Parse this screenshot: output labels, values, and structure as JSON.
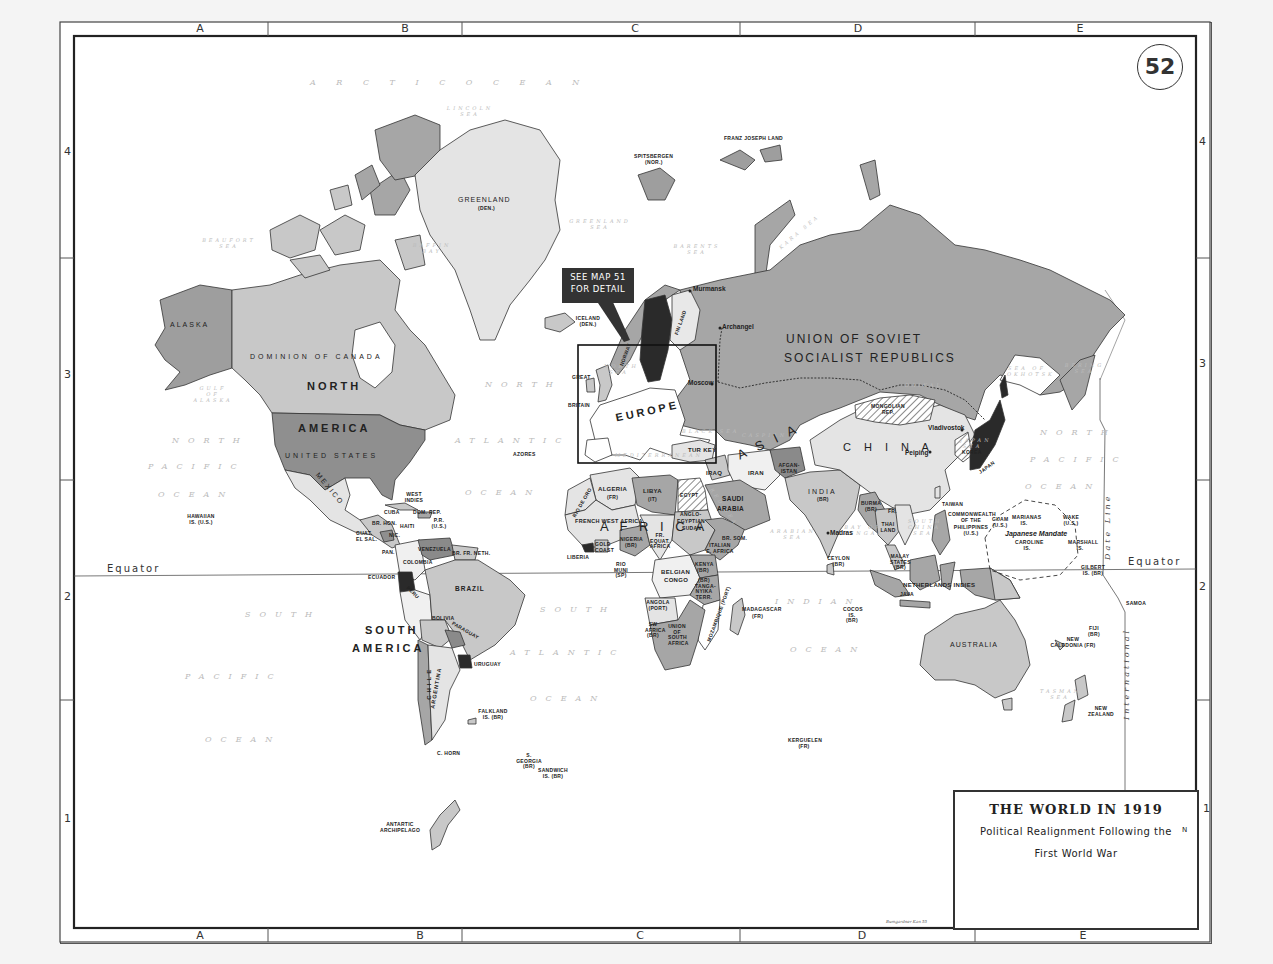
{
  "map": {
    "number": "52",
    "title": "THE WORLD IN 1919",
    "subtitle_line1": "Political Realignment Following the",
    "subtitle_line2": "First World War",
    "callout": {
      "line1": "SEE MAP 51",
      "line2": "FOR DETAIL"
    },
    "north_arrow": "N",
    "signature": "Bumgardner Kan 55"
  },
  "grid": {
    "columns_top": [
      "A",
      "B",
      "C",
      "D",
      "E"
    ],
    "columns_bottom": [
      "A",
      "B",
      "C",
      "D",
      "E"
    ],
    "rows_left": [
      "4",
      "3",
      "2",
      "1"
    ],
    "rows_right": [
      "4",
      "3",
      "2",
      "1"
    ]
  },
  "lines": {
    "equator_left": "Equator",
    "equator_right": "Equator",
    "date_line_top": "Date Line",
    "date_line_bottom": "International"
  },
  "continents": {
    "north_america_1": "NORTH",
    "north_america_2": "AMERICA",
    "south_america_1": "SOUTH",
    "south_america_2": "AMERICA",
    "europe": "EUROPE",
    "africa": "A F R I C A",
    "asia": "A S I A"
  },
  "oceans": {
    "arctic": "A R C T I C   O C E A N",
    "north_atlantic_1": "NORTH",
    "north_atlantic_2": "ATLANTIC",
    "north_atlantic_3": "OCEAN",
    "south_atlantic_1": "SOUTH",
    "south_atlantic_2": "ATLANTIC",
    "south_atlantic_3": "OCEAN",
    "north_pacific_w1": "NORTH",
    "north_pacific_w2": "PACIFIC",
    "north_pacific_w3": "OCEAN",
    "south_pacific_w1": "SOUTH",
    "south_pacific_w2": "PACIFIC",
    "south_pacific_w3": "OCEAN",
    "north_pacific_e1": "NORTH",
    "north_pacific_e2": "PACIFIC",
    "north_pacific_e3": "OCEAN",
    "indian_1": "INDIAN",
    "indian_2": "OCEAN"
  },
  "seas": {
    "lincoln": "LINCOLN SEA",
    "beaufort": "BEAUFORT SEA",
    "baffin": "BAFFIN BAY",
    "greenland": "GREENLAND SEA",
    "barents": "BARENTS SEA",
    "kara": "KARA SEA",
    "north_sea": "NORTH SEA",
    "gulf_alaska": "GULF OF ALASKA",
    "mediterranean": "MEDITERRANEAN",
    "black": "BLACK SEA",
    "caspian": "CASPIAN",
    "red": "RED SEA",
    "arabian": "ARABIAN SEA",
    "bay_bengal": "BAY OF BENGAL",
    "south_china": "SOUTH CHINA SEA",
    "japan": "JAPAN SEA",
    "okhotsk": "SEA OF OKHOTSK",
    "bering": "BERING SEA",
    "tasman": "TASMAN SEA",
    "baikal": "BAIKAL"
  },
  "countries": {
    "alaska": "ALASKA",
    "canada": "DOMINION OF CANADA",
    "usa": "UNITED STATES",
    "mexico": "MEXICO",
    "greenland": "GREENLAND",
    "greenland_owner": "(DEN.)",
    "iceland": "ICELAND (DEN.)",
    "spitsbergen": "SPITSBERGEN",
    "spitsbergen_owner": "(NOR.)",
    "franz_josef": "FRANZ JOSEPH LAND",
    "ussr_1": "UNION OF SOVIET",
    "ussr_2": "SOCIALIST REPUBLICS",
    "finland": "FIN LAND",
    "great_britain_1": "GREAT",
    "great_britain_2": "BRITAIN",
    "norway": "NORWAY",
    "turkey": "TUR KEY",
    "mongolia": "MONGOLIAN REP.",
    "china": "C H I N A",
    "korea": "KOREA",
    "japan": "JAPAN",
    "india": "INDIA",
    "india_owner": "(BR)",
    "iran": "IRAN",
    "iraq": "IRAQ",
    "afghanistan": "AFGAN- ISTAN",
    "saudi_1": "SAUDI",
    "saudi_2": "ARABIA",
    "burma": "BURMA (BR)",
    "thailand": "THAI LAND",
    "fr_indochina": "FR.",
    "malay": "MALAY STATES (BR)",
    "ceylon": "CEYLON (BR)",
    "taiwan": "TAIWAN",
    "philippines_1": "COMMONWEALTH OF THE",
    "philippines_2": "PHILIPPINES (U.S.)",
    "netherlands_indies": "NETHERLANDS INDIES",
    "java": "JAVA",
    "australia": "AUSTRALIA",
    "new_zealand": "NEW ZEALAND",
    "new_caledonia": "NEW CALEDONIA (FR)",
    "fiji": "FIJI (BR)",
    "samoa": "SAMOA",
    "japanese_mandate": "Japanese Mandate",
    "marianas": "MARIANAS IS.",
    "caroline": "CAROLINE IS.",
    "marshall": "MARSHALL IS.",
    "gilbert": "GILBERT IS. (BR)",
    "wake": "WAKE (U.S.)",
    "guam": "GUAM (U.S.)",
    "hawaiian": "HAWAIIAN IS. (U.S.)",
    "algeria": "ALGERIA",
    "algeria_owner": "(FR)",
    "libya": "LIBYA",
    "libya_owner": "(IT)",
    "egypt": "EGYPT",
    "rio_de_oro": "RIO DE ORO",
    "french_west_africa": "FRENCH WEST AFRICA",
    "nigeria": "NIGERIA (BR)",
    "gold_coast": "GOLD COAST",
    "liberia": "LIBERIA",
    "rio_muni": "RIO MUNI (SP)",
    "fr_equat": "FR. EQUAT. AFRICA",
    "anglo_egyptian_1": "ANGLO-",
    "anglo_egyptian_2": "EGYPTIAN",
    "anglo_egyptian_3": "SUDAN",
    "br_som": "BR. SOM.",
    "italian_e_africa": "ITALIAN E. AFRICA",
    "kenya": "KENYA (BR)",
    "tanganyika": "(BR) TANGA- NYIKA TERR.",
    "belgian_congo_1": "BELGIAN",
    "belgian_congo_2": "CONGO",
    "angola": "ANGOLA (PORT)",
    "sw_africa": "SW AFRICA (BR)",
    "union_south_africa": "UNION OF SOUTH AFRICA",
    "mozambique": "MOZAMBIQUE (PORT)",
    "madagascar": "MADAGASCAR",
    "madagascar_owner": "(FR)",
    "kerguelen": "KERGUELEN (FR)",
    "cocos": "COCOS IS. (BR)",
    "azores": "AZORES",
    "west_indies": "WEST INDIES",
    "cuba": "CUBA",
    "dom_rep": "DOM. REP.",
    "haiti": "HAITI",
    "pr": "P.R. (U.S.)",
    "br_hon": "BR. HON.",
    "guat": "GUAT.",
    "el_sal": "EL SAL.",
    "nic": "NIC.",
    "pan": "PAN.",
    "venezuela": "VENEZUELA",
    "br_guiana": "BR. FR. NETH.",
    "colombia": "COLOMBIA",
    "ecuador": "ECUADOR",
    "peru": "PERU",
    "brazil": "BRAZIL",
    "bolivia": "BOLIVIA",
    "paraguay": "PARAGUAY",
    "uruguay": "URUGUAY",
    "chile": "CHILE",
    "argentina": "ARGENTINA",
    "falkland": "FALKLAND IS. (BR)",
    "s_georgia": "S. GEORGIA (BR)",
    "sandwich": "SANDWICH IS. (BR)",
    "c_horn": "C. HORN",
    "antarctic": "ANTARTIC ARCHIPELAGO"
  },
  "cities": {
    "murmansk": "Murmansk",
    "archangel": "Archangel",
    "moscow": "Moscow",
    "vladivostok": "Vladivostok",
    "peiping": "Peiping",
    "madras": "Madras"
  },
  "colors": {
    "paper": "#ffffff",
    "background": "#f4f4f4",
    "light_land": "#e4e4e4",
    "mid_land": "#c4c4c4",
    "dark_land": "#a6a6a6",
    "darker_land": "#8a8a8a",
    "black_land": "#2a2a2a",
    "border": "#333333"
  }
}
